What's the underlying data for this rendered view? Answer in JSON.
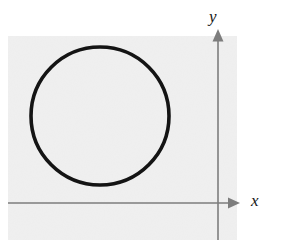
{
  "figure": {
    "background_color": "#ffffff",
    "plate": {
      "name": "gray-backdrop",
      "fill_color": "#f0f0f0",
      "x": 8,
      "y": 36,
      "width": 229,
      "height": 204
    },
    "axes": {
      "color": "#7d7d7d",
      "stroke_width": 1.6,
      "origin": {
        "x": 218,
        "y": 203
      },
      "x_axis": {
        "name": "x-axis",
        "label": "x",
        "from_x": 8,
        "to_x": 232,
        "y": 203,
        "arrow": "right",
        "arrow_tip_x": 240
      },
      "y_axis": {
        "name": "y-axis",
        "label": "y",
        "x": 218,
        "from_y": 240,
        "to_y": 38,
        "arrow": "up",
        "arrow_tip_y": 29
      }
    },
    "shapes": [
      {
        "name": "circle",
        "type": "circle",
        "cx": 100,
        "cy": 116,
        "r": 69,
        "stroke_color": "#141414",
        "stroke_width": 3.6,
        "fill": "none"
      }
    ]
  },
  "chart_data": {
    "type": "scatter",
    "title": "",
    "xlabel": "x",
    "ylabel": "y",
    "grid": false,
    "legend": "none",
    "annotations": [
      {
        "kind": "circle",
        "description": "A closed circular curve drawn entirely in the region to the left of the y-axis and above the x-axis (second quadrant side of the drawn axes).",
        "center_px": [
          100,
          116
        ],
        "radius_px": 69
      }
    ],
    "axis_origin_px": [
      218,
      203
    ],
    "series": []
  }
}
